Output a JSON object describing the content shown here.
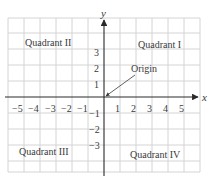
{
  "diagram": {
    "axes": {
      "x_label": "x",
      "y_label": "y"
    },
    "x_ticks": [
      "−5",
      "−4",
      "−3",
      "−2",
      "−1",
      "1",
      "2",
      "3",
      "4",
      "5"
    ],
    "y_ticks_positive": [
      "3",
      "2",
      "1"
    ],
    "y_ticks_negative": [
      "−1",
      "−2",
      "−3"
    ],
    "quadrants": {
      "q1": "Quadrant I",
      "q2": "Quadrant II",
      "q3": "Quadrant III",
      "q4": "Quadrant IV"
    },
    "annotation": {
      "label": "Origin",
      "arrow_target": "origin"
    },
    "colors": {
      "grid": "#d4d4d4",
      "axis": "#2a2a2a",
      "text": "#3a3a3a",
      "background": "#ffffff"
    }
  }
}
